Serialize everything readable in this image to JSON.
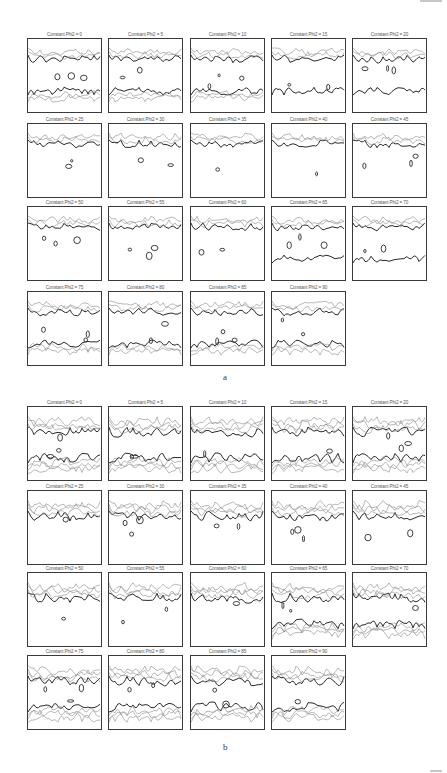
{
  "figure": {
    "parts": [
      {
        "label": "a",
        "top": 38,
        "label_pos": {
          "x": 223,
          "y": 372
        },
        "row_tops": [
          0,
          85,
          168,
          253
        ],
        "panels": [
          {
            "title": "Constant Phi2 = 0",
            "row": 0,
            "col": 0,
            "variant": "a-top-bottom"
          },
          {
            "title": "Constant Phi2 = 5",
            "row": 0,
            "col": 1,
            "variant": "a-top-bottom"
          },
          {
            "title": "Constant Phi2 = 10",
            "row": 0,
            "col": 2,
            "variant": "a-top-bottom"
          },
          {
            "title": "Constant Phi2 = 15",
            "row": 0,
            "col": 3,
            "variant": "a-top-bottom-sparse"
          },
          {
            "title": "Constant Phi2 = 20",
            "row": 0,
            "col": 4,
            "variant": "a-top-bottom-sparse"
          },
          {
            "title": "Constant Phi2 = 25",
            "row": 1,
            "col": 0,
            "variant": "a-top"
          },
          {
            "title": "Constant Phi2 = 30",
            "row": 1,
            "col": 1,
            "variant": "a-top"
          },
          {
            "title": "Constant Phi2 = 35",
            "row": 1,
            "col": 2,
            "variant": "a-top"
          },
          {
            "title": "Constant Phi2 = 40",
            "row": 1,
            "col": 3,
            "variant": "a-top"
          },
          {
            "title": "Constant Phi2 = 45",
            "row": 1,
            "col": 4,
            "variant": "a-top"
          },
          {
            "title": "Constant Phi2 = 50",
            "row": 2,
            "col": 0,
            "variant": "a-top"
          },
          {
            "title": "Constant Phi2 = 55",
            "row": 2,
            "col": 1,
            "variant": "a-top"
          },
          {
            "title": "Constant Phi2 = 60",
            "row": 2,
            "col": 2,
            "variant": "a-top"
          },
          {
            "title": "Constant Phi2 = 65",
            "row": 2,
            "col": 3,
            "variant": "a-top-bottom-sparse"
          },
          {
            "title": "Constant Phi2 = 70",
            "row": 2,
            "col": 4,
            "variant": "a-top-bottom-sparse"
          },
          {
            "title": "Constant Phi2 = 75",
            "row": 3,
            "col": 0,
            "variant": "a-top-bottom"
          },
          {
            "title": "Constant Phi2 = 80",
            "row": 3,
            "col": 1,
            "variant": "a-top-bottom"
          },
          {
            "title": "Constant Phi2 = 85",
            "row": 3,
            "col": 2,
            "variant": "a-top-bottom"
          },
          {
            "title": "Constant Phi2 = 90",
            "row": 3,
            "col": 3,
            "variant": "a-top-bottom"
          }
        ]
      },
      {
        "label": "b",
        "top": 406,
        "label_pos": {
          "x": 223,
          "y": 742
        },
        "row_tops": [
          0,
          84,
          166,
          249
        ],
        "panels": [
          {
            "title": "Constant Phi2 = 0",
            "row": 0,
            "col": 0,
            "variant": "b-dense"
          },
          {
            "title": "Constant Phi2 = 5",
            "row": 0,
            "col": 1,
            "variant": "b-dense"
          },
          {
            "title": "Constant Phi2 = 10",
            "row": 0,
            "col": 2,
            "variant": "b-dense"
          },
          {
            "title": "Constant Phi2 = 15",
            "row": 0,
            "col": 3,
            "variant": "b-dense"
          },
          {
            "title": "Constant Phi2 = 20",
            "row": 0,
            "col": 4,
            "variant": "b-dense"
          },
          {
            "title": "Constant Phi2 = 25",
            "row": 1,
            "col": 0,
            "variant": "b-top"
          },
          {
            "title": "Constant Phi2 = 30",
            "row": 1,
            "col": 1,
            "variant": "b-top"
          },
          {
            "title": "Constant Phi2 = 35",
            "row": 1,
            "col": 2,
            "variant": "b-top"
          },
          {
            "title": "Constant Phi2 = 40",
            "row": 1,
            "col": 3,
            "variant": "b-top"
          },
          {
            "title": "Constant Phi2 = 45",
            "row": 1,
            "col": 4,
            "variant": "b-top"
          },
          {
            "title": "Constant Phi2 = 50",
            "row": 2,
            "col": 0,
            "variant": "b-top"
          },
          {
            "title": "Constant Phi2 = 55",
            "row": 2,
            "col": 1,
            "variant": "b-top"
          },
          {
            "title": "Constant Phi2 = 60",
            "row": 2,
            "col": 2,
            "variant": "b-top"
          },
          {
            "title": "Constant Phi2 = 65",
            "row": 2,
            "col": 3,
            "variant": "b-top-bottom"
          },
          {
            "title": "Constant Phi2 = 70",
            "row": 2,
            "col": 4,
            "variant": "b-top-bottom"
          },
          {
            "title": "Constant Phi2 = 75",
            "row": 3,
            "col": 0,
            "variant": "b-dense"
          },
          {
            "title": "Constant Phi2 = 80",
            "row": 3,
            "col": 1,
            "variant": "b-dense"
          },
          {
            "title": "Constant Phi2 = 85",
            "row": 3,
            "col": 2,
            "variant": "b-dense"
          },
          {
            "title": "Constant Phi2 = 90",
            "row": 3,
            "col": 3,
            "variant": "b-dense"
          }
        ]
      }
    ],
    "col_lefts": [
      27,
      108,
      190,
      271,
      352
    ],
    "colors": {
      "contour_major": "#2a2a2a",
      "contour_minor": "#8a8a8a",
      "frame": "#3a3a3a",
      "title": "#555555"
    }
  }
}
